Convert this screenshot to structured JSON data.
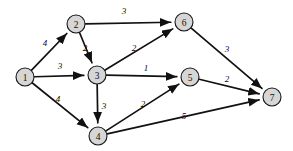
{
  "figure": {
    "type": "directed-weighted-graph",
    "width": 293,
    "height": 151,
    "background_color": "#ffffff",
    "node_fill_color": "#d6d6d6",
    "node_stroke_color": "#161616",
    "edge_color": "#111111",
    "node_radius": 9
  },
  "chart_data": {
    "type": "diagram",
    "title": "",
    "nodes": [
      {
        "id": "1",
        "label": "1",
        "x": 25,
        "y": 77
      },
      {
        "id": "2",
        "label": "2",
        "x": 76,
        "y": 24
      },
      {
        "id": "3",
        "label": "3",
        "x": 97,
        "y": 75
      },
      {
        "id": "4",
        "label": "4",
        "x": 98,
        "y": 136
      },
      {
        "id": "5",
        "label": "5",
        "x": 190,
        "y": 77
      },
      {
        "id": "6",
        "label": "6",
        "x": 184,
        "y": 22
      },
      {
        "id": "7",
        "label": "7",
        "x": 272,
        "y": 97
      }
    ],
    "edges": [
      {
        "from": "1",
        "to": "2",
        "weight": "4",
        "lx": 45,
        "ly": 43
      },
      {
        "from": "1",
        "to": "3",
        "weight": "3",
        "lx": 60,
        "ly": 66
      },
      {
        "from": "1",
        "to": "4",
        "weight": "4",
        "lx": 58,
        "ly": 99
      },
      {
        "from": "2",
        "to": "6",
        "weight": "3",
        "lx": 124,
        "ly": 11
      },
      {
        "from": "2",
        "to": "3",
        "weight": "2",
        "lx": 85,
        "ly": 48
      },
      {
        "from": "3",
        "to": "6",
        "weight": "2",
        "lx": 134,
        "ly": 48
      },
      {
        "from": "3",
        "to": "5",
        "weight": "1",
        "lx": 146,
        "ly": 68
      },
      {
        "from": "3",
        "to": "4",
        "weight": "3",
        "lx": 104,
        "ly": 106
      },
      {
        "from": "4",
        "to": "5",
        "weight": "2",
        "lx": 143,
        "ly": 104
      },
      {
        "from": "4",
        "to": "7",
        "weight": "5",
        "lx": 184,
        "ly": 116
      },
      {
        "from": "5",
        "to": "7",
        "weight": "2",
        "lx": 227,
        "ly": 79
      },
      {
        "from": "6",
        "to": "7",
        "weight": "3",
        "lx": 227,
        "ly": 49
      }
    ]
  }
}
